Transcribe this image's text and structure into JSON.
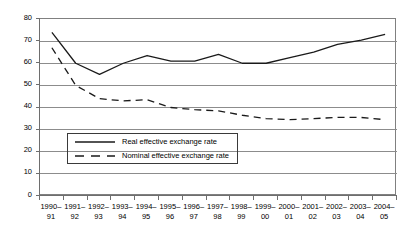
{
  "chart_data": {
    "type": "line",
    "title": "",
    "subtitle": "",
    "xlabel": "",
    "ylabel": "",
    "ylim": [
      0,
      80
    ],
    "ytick_step": 10,
    "yticks": [
      80,
      70,
      60,
      50,
      40,
      30,
      20,
      10,
      0
    ],
    "grid": true,
    "grid_axis": "y",
    "legend_position": "inside-lower-left",
    "categories": [
      "1990– 91",
      "1991– 92",
      "1992– 93",
      "1993– 94",
      "1994– 95",
      "1995– 96",
      "1996– 97",
      "1997– 98",
      "1998– 99",
      "1999– 00",
      "2000– 01",
      "2001– 02",
      "2002– 03",
      "2003– 04",
      "2004– 05"
    ],
    "categories_split": [
      [
        "1990–",
        "91"
      ],
      [
        "1991–",
        "92"
      ],
      [
        "1992–",
        "93"
      ],
      [
        "1993–",
        "94"
      ],
      [
        "1994–",
        "95"
      ],
      [
        "1995–",
        "96"
      ],
      [
        "1996–",
        "97"
      ],
      [
        "1997–",
        "98"
      ],
      [
        "1998–",
        "99"
      ],
      [
        "1999–",
        "00"
      ],
      [
        "2000–",
        "01"
      ],
      [
        "2001–",
        "02"
      ],
      [
        "2002–",
        "03"
      ],
      [
        "2003–",
        "04"
      ],
      [
        "2004–",
        "05"
      ]
    ],
    "series": [
      {
        "name": "Real effective exchange rate",
        "style": "solid",
        "color": "#1a1a1a",
        "values": [
          74,
          60,
          55,
          60,
          63.5,
          61,
          61,
          64,
          60,
          60,
          62.5,
          65,
          68.5,
          70.5,
          73
        ]
      },
      {
        "name": "Nominal effective exchange rate",
        "style": "dashed",
        "color": "#1a1a1a",
        "values": [
          67,
          50,
          44,
          43,
          43.5,
          40,
          39,
          38.5,
          36.5,
          35,
          34.5,
          35,
          35.5,
          35.5,
          34.5
        ]
      }
    ]
  },
  "legend": {
    "items": [
      {
        "label": "Real effective exchange rate"
      },
      {
        "label": "Nominal effective exchange rate"
      }
    ]
  },
  "colors": {
    "series_line": "#1a1a1a",
    "gridline": "#8c8c8c",
    "axis": "#6e6e6e",
    "plot_border": "#808080",
    "legend_border": "#3a3a3a",
    "background": "#ffffff",
    "text": "#000000"
  }
}
